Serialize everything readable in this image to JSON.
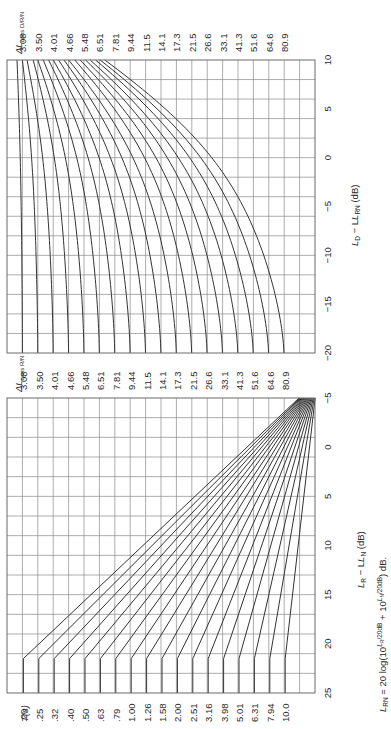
{
  "chart_data": [
    {
      "type": "line",
      "title": "",
      "orientation": "rotated 90° counter-clockwise",
      "xlabel": "L_D − L_RN (dB)",
      "ylabel": "",
      "xlim": [
        -20,
        10
      ],
      "x_ticks": [
        "-20",
        "-15",
        "-10",
        "-5",
        "0",
        "5",
        "10"
      ],
      "grid": true,
      "legend_title": "ΔL_cons D/R/N",
      "legend_title_main": "ΔL",
      "legend_title_sub": "cons D/R/N",
      "series_labels": [
        "3.08",
        "3.50",
        "4.01",
        "4.66",
        "5.48",
        "6.51",
        "7.81",
        "9.44",
        "11.5",
        "14.1",
        "17.3",
        "21.5",
        "26.6",
        "33.1",
        "41.3",
        "51.6",
        "64.6",
        "80.9"
      ],
      "series_start_index": [
        1,
        2,
        3,
        4,
        5,
        6,
        7,
        8,
        9,
        10,
        11,
        12,
        13,
        14,
        15,
        16,
        17,
        18
      ],
      "series_end_index_at_x10": [
        0.65,
        1.0,
        1.3,
        1.7,
        2.0,
        2.35,
        2.7,
        3.0,
        3.35,
        3.7,
        4.0,
        4.4,
        4.75,
        5.1,
        5.4,
        5.75,
        6.05,
        6.35
      ]
    },
    {
      "type": "line",
      "title": "",
      "orientation": "rotated 90° counter-clockwise",
      "xlabel": "L_R − L_N (dB)",
      "ylabel": "",
      "xlim": [
        -5,
        25
      ],
      "x_ticks": [
        "-5",
        "0",
        "5",
        "10",
        "15",
        "20",
        "25"
      ],
      "grid": true,
      "legend_title": "T(s)",
      "series_labels": [
        ".20",
        ".25",
        ".32",
        ".40",
        ".50",
        ".63",
        ".79",
        "1.00",
        "1.26",
        "1.58",
        "2.00",
        "2.51",
        "3.16",
        "3.98",
        "5.01",
        "6.31",
        "7.94",
        "10.0"
      ],
      "right_axis_title": "ΔL_cons R/N",
      "right_axis_title_main": "ΔL",
      "right_axis_title_sub": "cons R/N",
      "right_axis_labels": [
        "3.08",
        "3.50",
        "4.01",
        "4.66",
        "5.48",
        "6.51",
        "7.81",
        "9.44",
        "11.5",
        "14.1",
        "17.3",
        "21.5",
        "26.6",
        "33.1",
        "41.3",
        "51.6",
        "64.6",
        "80.9"
      ],
      "knee_x": 21.5,
      "formula": "L_RN = 20 log(10^(L_R/20dB) + 10^(L_N/20dB)) dB."
    }
  ],
  "labels": {
    "upper_axis_title": "L",
    "upper_axis_title_sub1": "D",
    "upper_axis_title_mid": " − L",
    "upper_axis_title_sub2": "RN",
    "upper_axis_title_unit": " (dB)",
    "lower_axis_title": "L",
    "lower_axis_title_sub1": "R",
    "lower_axis_title_mid": " − L",
    "lower_axis_title_sub2": "N",
    "lower_axis_title_unit": " (dB)",
    "formula_lhs": "L",
    "formula_lhs_sub": "RN",
    "formula_mid": " = 20 log(10",
    "formula_exp1": "L",
    "formula_exp1_sub": "R",
    "formula_exp1_rest": "/20dB",
    "formula_plus": " + 10",
    "formula_exp2": "L",
    "formula_exp2_sub": "N",
    "formula_exp2_rest": "/20dB",
    "formula_end": ") dB."
  },
  "colors": {
    "grid": "#8a8a8a",
    "curve": "#333333",
    "frame": "#6a6a6a",
    "text": "#2a2a2a"
  }
}
